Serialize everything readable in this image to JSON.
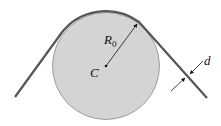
{
  "diagram": {
    "labels": {
      "radius": "R",
      "radius_sub": "0",
      "center": "C",
      "thickness": "d"
    },
    "colors": {
      "disk_fill": "#d4d4d4",
      "disk_stroke": "#8a8a8a",
      "band": "#555555",
      "text": "#111111"
    }
  }
}
